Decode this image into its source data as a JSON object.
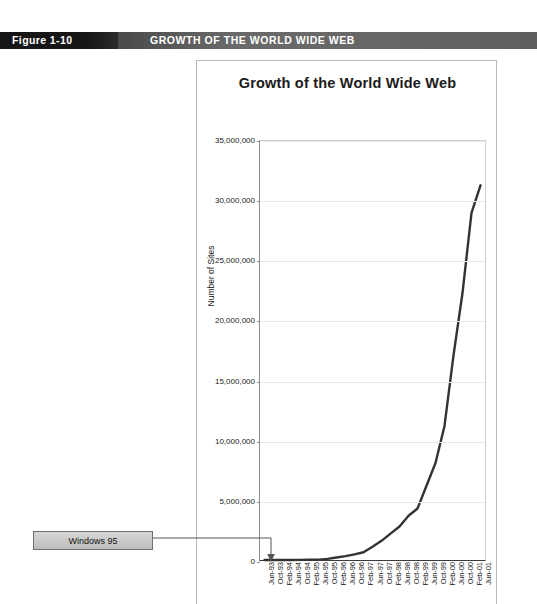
{
  "figure": {
    "number": "Figure 1-10",
    "caption": "GROWTH OF THE WORLD WIDE WEB"
  },
  "colors": {
    "bar_dark": "#151515",
    "bar_light": "#6a6a6a",
    "bar_text": "#ffffff",
    "curve": "#333333",
    "grid": "#e8e8e8",
    "callout_fill": "#c8c8c8",
    "callout_border": "#6f6f6f"
  },
  "annotations": [
    {
      "label": "Windows 95",
      "points_to": "Oct-95"
    }
  ],
  "chart_data": {
    "type": "line",
    "title": "Growth of the World Wide Web",
    "xlabel": "",
    "ylabel": "Number of Sites",
    "ylim": [
      0,
      35000000
    ],
    "ytick_values": [
      0,
      5000000,
      10000000,
      15000000,
      20000000,
      25000000,
      30000000,
      35000000
    ],
    "ytick_labels": [
      "0",
      "5,000,000",
      "10,000,000",
      "15,000,000",
      "20,000,000",
      "25,000,000",
      "30,000,000",
      "35,000,000"
    ],
    "grid": true,
    "legend": null,
    "categories": [
      "Jun-93",
      "Oct-93",
      "Feb-94",
      "Jun-94",
      "Oct-94",
      "Feb-95",
      "Jun-95",
      "Oct-95",
      "Feb-96",
      "Jun-96",
      "Oct-96",
      "Feb-97",
      "Jun-97",
      "Oct-97",
      "Feb-98",
      "Jun-98",
      "Oct-98",
      "Feb-99",
      "Jun-99",
      "Oct-99",
      "Feb-00",
      "Jun-00",
      "Oct-00",
      "Feb-01",
      "Jun-01"
    ],
    "values": [
      130,
      228,
      1130,
      2738,
      10022,
      27000,
      23500,
      90000,
      210000,
      320000,
      470000,
      650000,
      1100000,
      1600000,
      2200000,
      2800000,
      3700000,
      4300000,
      6200000,
      8100000,
      11200000,
      17100000,
      22300000,
      29000000,
      31300000
    ]
  }
}
